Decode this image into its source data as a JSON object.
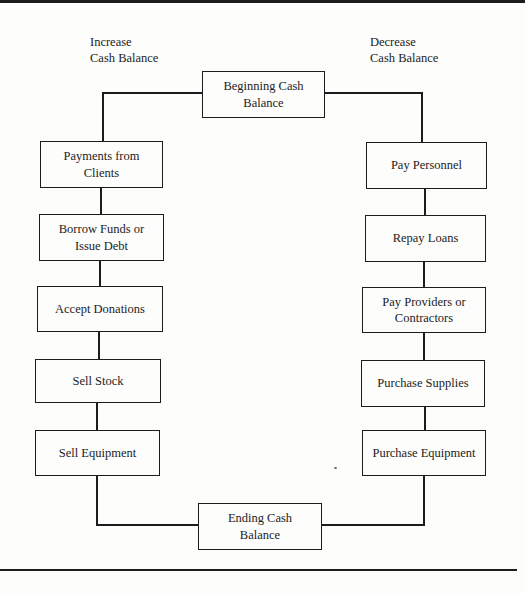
{
  "page": {
    "background": "#fdfdfc",
    "ink": "#1c1c1c"
  },
  "headers": {
    "left": "Increase\nCash Balance",
    "right": "Decrease\nCash Balance"
  },
  "nodes": {
    "beginning": "Beginning Cash\nBalance",
    "ending": "Ending Cash\nBalance",
    "left": [
      "Payments from\nClients",
      "Borrow Funds or\nIssue Debt",
      "Accept Donations",
      "Sell Stock",
      "Sell Equipment"
    ],
    "right": [
      "Pay Personnel",
      "Repay Loans",
      "Pay Providers or\nContractors",
      "Purchase Supplies",
      "Purchase Equipment"
    ]
  }
}
